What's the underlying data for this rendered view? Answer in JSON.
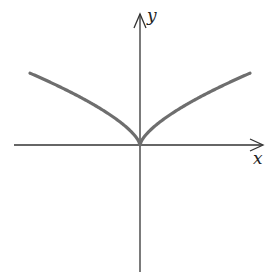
{
  "chart_data": {
    "type": "line",
    "title": "",
    "function": "y = |x|^(2/3)",
    "xlabel": "x",
    "ylabel": "y",
    "xlim": [
      -3.0,
      2.8
    ],
    "ylim": [
      -2.9,
      2.9
    ],
    "grid": false,
    "legend": null,
    "ticks": "none",
    "annotations": [
      "cusp at origin"
    ],
    "series": [
      {
        "name": "curve",
        "color": "#6e6e6e",
        "x": [
          -2.5,
          -2.0,
          -1.5,
          -1.0,
          -0.5,
          -0.25,
          -0.1,
          0,
          0.1,
          0.25,
          0.5,
          1.0,
          1.5,
          2.0,
          2.5
        ],
        "y": [
          1.84,
          1.59,
          1.31,
          1.0,
          0.63,
          0.4,
          0.22,
          0,
          0.22,
          0.4,
          0.63,
          1.0,
          1.31,
          1.59,
          1.84
        ]
      }
    ]
  },
  "axes": {
    "x_label": "x",
    "y_label": "y",
    "axis_color": "#333333",
    "curve_color": "#6e6e6e"
  }
}
